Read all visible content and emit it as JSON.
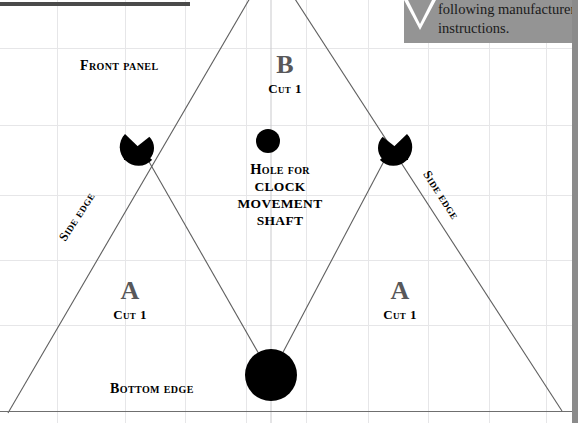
{
  "page": {
    "width": 578,
    "height": 423,
    "background_color": "#ffffff",
    "grid_color": "#e6e6e8",
    "border_color": "#8b8b8b"
  },
  "callout": {
    "background_color": "#949494",
    "line1": "following manufacturer",
    "line2": "instructions.",
    "arrow": "down-triangle"
  },
  "labels": {
    "front_panel": "Front panel",
    "bottom_edge": "Bottom edge",
    "side_edge_left": "Side edge",
    "side_edge_right": "Side edge"
  },
  "pieces": [
    {
      "id": "b",
      "letter": "B",
      "cut": "Cut 1"
    },
    {
      "id": "a-left",
      "letter": "A",
      "cut": "Cut 1"
    },
    {
      "id": "a-right",
      "letter": "A",
      "cut": "Cut 1"
    }
  ],
  "hole_note": {
    "line1": "Hole for",
    "line2": "CLOCK",
    "line3": "MOVEMENT",
    "line4": "SHAFT"
  },
  "colors": {
    "letter_gray": "#58585a",
    "ink_black": "#000000",
    "line_gray": "#6f6f6f"
  },
  "drawing": {
    "type": "sewing-pattern-template",
    "shapes": [
      {
        "name": "hole-for-shaft-circle",
        "cx": 268,
        "cy": 141,
        "r": 12,
        "fill": "#000000"
      },
      {
        "name": "bottom-center-circle",
        "cx": 271,
        "cy": 375,
        "r": 26,
        "fill": "#000000"
      },
      {
        "name": "left-vertex-half-circle",
        "cx": 140,
        "cy": 146,
        "r": 18,
        "fill": "#000000"
      },
      {
        "name": "right-vertex-half-circle",
        "cx": 392,
        "cy": 146,
        "r": 18,
        "fill": "#000000"
      }
    ]
  }
}
